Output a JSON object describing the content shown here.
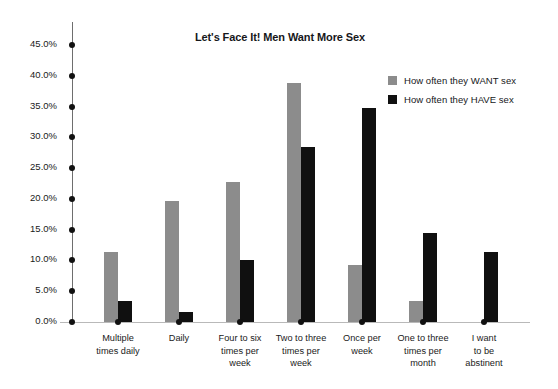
{
  "chart_data": {
    "type": "bar",
    "title": "Let's Face It! Men Want More Sex",
    "xlabel": "",
    "ylabel": "",
    "ylim": [
      0,
      45
    ],
    "grid": false,
    "legend_position": "top-right",
    "categories": [
      "Multiple times daily",
      "Daily",
      "Four to six times per week",
      "Two to three times per week",
      "Once per week",
      "One to three times per month",
      "I want to be abstinent"
    ],
    "category_lines": [
      [
        "Multiple",
        "times daily"
      ],
      [
        "Daily"
      ],
      [
        "Four to six",
        "times per",
        "week"
      ],
      [
        "Two to three",
        "times per",
        "week"
      ],
      [
        "Once per",
        "week"
      ],
      [
        "One to three",
        "times per",
        "month"
      ],
      [
        "I want",
        "to be",
        "abstinent"
      ]
    ],
    "ytick_labels": [
      "0.0%",
      "5.0%",
      "10.0%",
      "15.0%",
      "20.0%",
      "25.0%",
      "30.0%",
      "35.0%",
      "40.0%",
      "45.0%"
    ],
    "ytick_values": [
      0,
      5,
      10,
      15,
      20,
      25,
      30,
      35,
      40,
      45
    ],
    "series": [
      {
        "name": "How often they WANT sex",
        "color": "#8c8c8c",
        "values": [
          11.4,
          19.6,
          22.7,
          38.9,
          9.2,
          3.4,
          0
        ]
      },
      {
        "name": "How often they HAVE sex",
        "color": "#101010",
        "values": [
          3.4,
          1.7,
          10.1,
          28.5,
          34.7,
          14.4,
          11.3
        ]
      }
    ]
  },
  "colors": {
    "want_sex": "#8c8c8c",
    "have_sex": "#101010",
    "axis": "#6e6e6e",
    "baseline": "#b9b9b9",
    "text": "#1a1a1a",
    "background": "#ffffff"
  }
}
